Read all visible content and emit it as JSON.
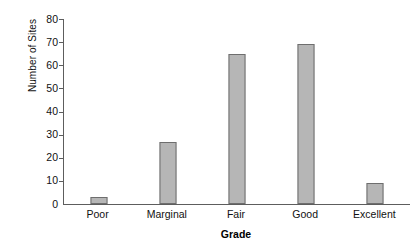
{
  "chart_data": {
    "type": "bar",
    "title": "",
    "categories": [
      "Poor",
      "Marginal",
      "Fair",
      "Good",
      "Excellent"
    ],
    "values": [
      3,
      27,
      65,
      69,
      9
    ],
    "xlabel": "Grade",
    "ylabel": "Number of Sites",
    "ylim": [
      0,
      80
    ],
    "ytick_labels": [
      "80",
      "70",
      "60",
      "50",
      "40",
      "30",
      "20",
      "10",
      "0"
    ],
    "ytick_values": [
      80,
      70,
      60,
      50,
      40,
      30,
      20,
      10,
      0
    ],
    "grid": false,
    "legend": null,
    "colors": {
      "bar_fill": "#b6b6b6",
      "bar_edge": "#6e6e6e",
      "axis": "#5d5d5d",
      "text": "#111111",
      "background": "#ffffff"
    }
  }
}
